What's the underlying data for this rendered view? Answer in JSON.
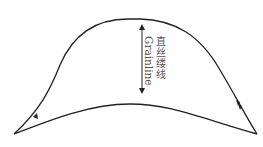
{
  "diagram": {
    "type": "pattern-piece",
    "grainline_label_cn": "直丝缕线",
    "grainline_label_en": "Grainline",
    "stroke_color": "#222222",
    "label_color": "#555555",
    "notches": [
      {
        "position": "left-lower",
        "count": 1
      },
      {
        "position": "right-lower",
        "count": 2
      }
    ]
  }
}
